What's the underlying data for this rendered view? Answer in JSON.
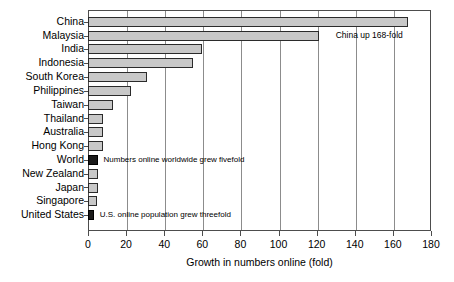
{
  "chart_data": {
    "type": "bar",
    "orientation": "horizontal",
    "title": "",
    "xlabel": "Growth in numbers online (fold)",
    "ylabel": "",
    "xlim": [
      0,
      180
    ],
    "xticks": [
      0,
      20,
      40,
      60,
      80,
      100,
      120,
      140,
      160,
      180
    ],
    "grid": "vertical",
    "legend": "none",
    "categories": [
      "China",
      "Malaysia",
      "India",
      "Indonesia",
      "South Korea",
      "Philippines",
      "Taiwan",
      "Thailand",
      "Australia",
      "Hong Kong",
      "World",
      "New Zealand",
      "Japan",
      "Singapore",
      "United States"
    ],
    "values": [
      168,
      121,
      60,
      55,
      31,
      22.5,
      13,
      8,
      8,
      8,
      5,
      5.5,
      5.5,
      4.5,
      3
    ],
    "bar_colors": [
      "#c8c8c8",
      "#c8c8c8",
      "#c8c8c8",
      "#c8c8c8",
      "#c8c8c8",
      "#c8c8c8",
      "#c8c8c8",
      "#c8c8c8",
      "#c8c8c8",
      "#c8c8c8",
      "#1a1a1a",
      "#c8c8c8",
      "#c8c8c8",
      "#c8c8c8",
      "#1a1a1a"
    ],
    "highlight_color": "#1a1a1a",
    "bar_color": "#c8c8c8",
    "annotations": [
      {
        "text": "China up 168-fold",
        "category": "China"
      },
      {
        "text": "Numbers online worldwide grew fivefold",
        "category": "World"
      },
      {
        "text": "U.S. online population grew threefold",
        "category": "United States"
      }
    ]
  }
}
